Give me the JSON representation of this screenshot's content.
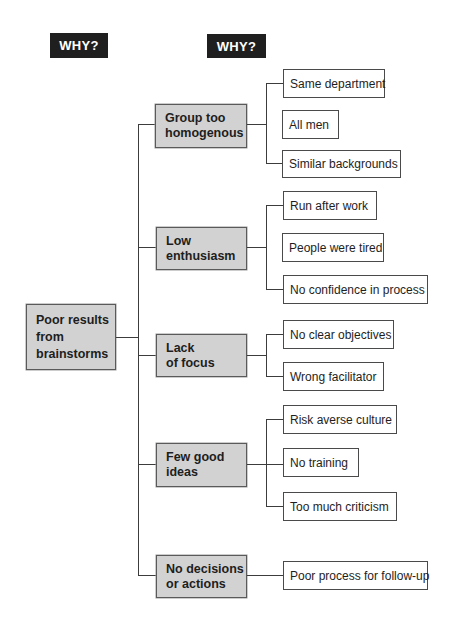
{
  "headers": {
    "level1": "WHY?",
    "level2": "WHY?"
  },
  "root": {
    "label_lines": [
      "Poor results",
      "from",
      "brainstorms"
    ]
  },
  "causes": [
    {
      "label_lines": [
        "Group too",
        "homogenous"
      ],
      "subcauses": [
        "Same department",
        "All men",
        "Similar backgrounds"
      ]
    },
    {
      "label_lines": [
        "Low",
        "enthusiasm"
      ],
      "subcauses": [
        "Run after work",
        "People were tired",
        "No confidence in process"
      ]
    },
    {
      "label_lines": [
        "Lack",
        "of focus"
      ],
      "subcauses": [
        "No clear objectives",
        "Wrong facilitator"
      ]
    },
    {
      "label_lines": [
        "Few good",
        "ideas"
      ],
      "subcauses": [
        "Risk averse culture",
        "No training",
        "Too much criticism"
      ]
    },
    {
      "label_lines": [
        "No decisions",
        "or actions"
      ],
      "subcauses": [
        "Poor process for follow-up"
      ]
    }
  ],
  "colors": {
    "header_bg": "#1f1f1f",
    "cause_fill": "#d2d2d2",
    "leaf_fill": "#ffffff",
    "line": "#3c3c3c"
  }
}
